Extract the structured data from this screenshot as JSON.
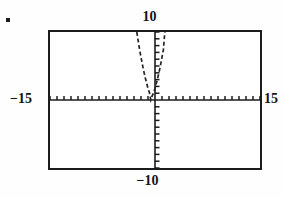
{
  "figure": {
    "bullet": "•",
    "caption": ""
  },
  "window": {
    "xmin_label": "−15",
    "xmax_label": "15",
    "ymax_label": "10",
    "ymin_label": "−10"
  },
  "colors": {
    "ink": "#1c1c1c",
    "frame": "#1c1c1c",
    "curve": "#232323",
    "background": "#ffffff"
  },
  "chart_data": {
    "type": "line",
    "title": "",
    "xlabel": "",
    "ylabel": "",
    "xlim": [
      -15,
      15
    ],
    "ylim": [
      -10,
      10
    ],
    "xtick_step": 1,
    "ytick_step": 1,
    "grid": false,
    "legend": null,
    "axis_style": "tick-marked-crosshair",
    "tick_marks": {
      "x_axis_ticks": 30,
      "y_axis_ticks": 20
    },
    "annotations": [
      {
        "text": "10",
        "position": "top-center",
        "meaning": "Ymax"
      },
      {
        "text": "−10",
        "position": "bottom-center",
        "meaning": "Ymin"
      },
      {
        "text": "−15",
        "position": "left-middle",
        "meaning": "Xmin"
      },
      {
        "text": "15",
        "position": "right-middle",
        "meaning": "Xmax"
      }
    ],
    "series": [
      {
        "name": "curve",
        "style": "dashed",
        "description": "narrow upward-opening parabola with vertex on the x-axis just left of the origin",
        "vertex": [
          -0.6,
          0
        ],
        "x": [
          -2.6,
          -2.4,
          -2.2,
          -2.0,
          -1.8,
          -1.6,
          -1.4,
          -1.2,
          -1.0,
          -0.8,
          -0.6,
          -0.4,
          -0.2,
          0.0,
          0.2,
          0.4,
          0.6,
          0.8,
          1.0,
          1.2,
          1.4
        ],
        "values": [
          10.0,
          8.7,
          7.4,
          6.3,
          5.2,
          4.2,
          3.3,
          2.5,
          1.7,
          1.1,
          0.0,
          0.6,
          1.1,
          1.7,
          2.5,
          3.3,
          4.2,
          5.2,
          6.3,
          7.4,
          10.0
        ]
      }
    ]
  }
}
